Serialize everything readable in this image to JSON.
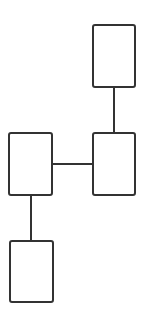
{
  "diagram": {
    "type": "tree",
    "stroke_color": "#333333",
    "background": "#ffffff",
    "nodes": [
      {
        "id": "node-top-right",
        "label": "",
        "x": 92,
        "y": 24,
        "w": 44,
        "h": 64
      },
      {
        "id": "node-mid-right",
        "label": "",
        "x": 92,
        "y": 132,
        "w": 44,
        "h": 64
      },
      {
        "id": "node-mid-left",
        "label": "",
        "x": 8,
        "y": 132,
        "w": 45,
        "h": 64
      },
      {
        "id": "node-bottom-left",
        "label": "",
        "x": 9,
        "y": 240,
        "w": 45,
        "h": 63
      }
    ],
    "edges": [
      {
        "from": "node-top-right",
        "to": "node-mid-right",
        "orientation": "vertical"
      },
      {
        "from": "node-mid-left",
        "to": "node-mid-right",
        "orientation": "horizontal"
      },
      {
        "from": "node-mid-left",
        "to": "node-bottom-left",
        "orientation": "vertical"
      }
    ]
  }
}
